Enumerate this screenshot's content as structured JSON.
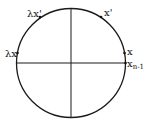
{
  "diagram": {
    "type": "circle-with-axes",
    "circle": {
      "cx": 71,
      "cy": 63,
      "r": 54.5
    },
    "stroke_color": "#1a1a1a",
    "labels": {
      "lambda_x": "λx",
      "lambda_x_prime": "λx'",
      "x_prime": "x'",
      "x": "x",
      "x_n_minus_1_base": "x",
      "x_n_minus_1_sub": "n-1"
    }
  }
}
